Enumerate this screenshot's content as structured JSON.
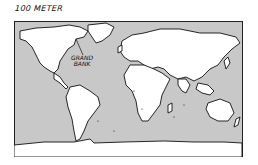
{
  "map": {
    "title": "100 METER",
    "labels": [
      {
        "text_line1": "GRAND",
        "text_line2": "BANK"
      }
    ],
    "colors": {
      "ocean": "#c8c8c8",
      "land": "#ffffff",
      "outline": "#111111",
      "frame": "#222222",
      "background": "#ffffff"
    }
  }
}
